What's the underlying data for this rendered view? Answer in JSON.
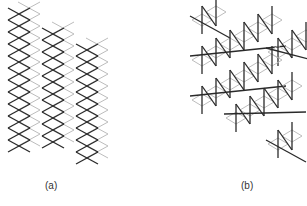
{
  "figure": {
    "colors": {
      "dark": "#2a2a2a",
      "light": "#bdbdbd",
      "background": "#ffffff"
    },
    "panels": [
      {
        "id": "a",
        "label": "(a)",
        "description": "Three staggered columns of diamond (zigzag) lattices; dark front layer, light back layer",
        "columns": [
          {
            "x": 8,
            "y_top": 8,
            "rows": 12
          },
          {
            "x": 42,
            "y_top": 28,
            "rows": 10
          },
          {
            "x": 76,
            "y_top": 44,
            "rows": 10
          }
        ],
        "cell": {
          "w": 22,
          "h": 12
        }
      },
      {
        "id": "b",
        "label": "(b)",
        "description": "Zigzag chains of vertical and diagonal bonds over light diamond lattice",
        "chains": [
          {
            "x": 202,
            "y": 20,
            "segments": 1
          },
          {
            "x": 202,
            "y": 60,
            "segments": 5
          },
          {
            "x": 278,
            "y": 52,
            "segments": 2
          },
          {
            "x": 202,
            "y": 100,
            "segments": 5
          },
          {
            "x": 236,
            "y": 118,
            "segments": 4
          },
          {
            "x": 278,
            "y": 144,
            "segments": 1
          }
        ]
      }
    ]
  }
}
